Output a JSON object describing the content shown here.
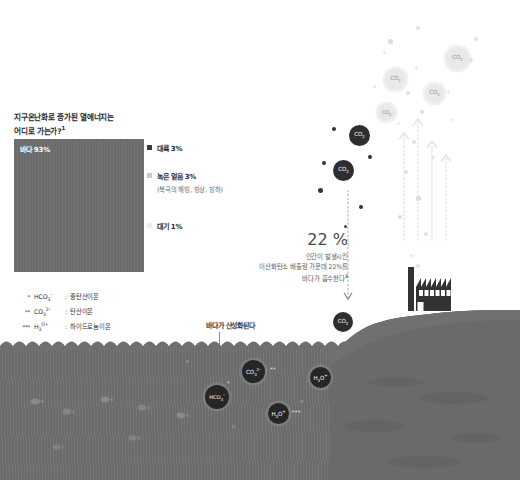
{
  "title": {
    "line1": "지구온난화로 증가된 열에너지는",
    "line2": "어디로 가는가?",
    "footnote_marker": "1"
  },
  "ocean_share": {
    "label": "바다 93%"
  },
  "legend": {
    "items": [
      {
        "label": "대륙 3%",
        "color": "#3a3a3a",
        "sub": null
      },
      {
        "label": "녹은 얼음 3%",
        "color": "#c9c9c9",
        "sub": "(북극의 해빙, 빙상, 빙하)"
      },
      {
        "label": "대기 1%",
        "color": "#ededed",
        "sub": null
      }
    ]
  },
  "footnote_key": {
    "rows": [
      {
        "stars": "*",
        "formula_main": "HCO",
        "formula_sub": "3",
        "formula_sup": "–",
        "separator": ":",
        "meaning": "중탄산이온"
      },
      {
        "stars": "**",
        "formula_main": "CO",
        "formula_sub": "3",
        "formula_sup": "2–",
        "separator": ":",
        "meaning": "탄산이온"
      },
      {
        "stars": "***",
        "formula_main": "H",
        "formula_sub": "3",
        "formula_sup": "O+",
        "separator": ":",
        "meaning": "하이드로늄이온"
      }
    ]
  },
  "percent_callout": {
    "value": "22 %",
    "line1": "인간이 발생시킨",
    "line2": "이산화탄소 배출량 가운데 22%를",
    "line3": "바다가 흡수한다",
    "footnote_marker": "3"
  },
  "acidification": {
    "label": "바다가 산성화된다"
  },
  "molecules": {
    "atmosphere_light": [
      {
        "formula": "CO",
        "sub": "2",
        "x": 446,
        "y": 47,
        "size": 23
      },
      {
        "formula": "CO",
        "sub": "2",
        "x": 385,
        "y": 69,
        "size": 21
      },
      {
        "formula": "CO",
        "sub": "2",
        "x": 425,
        "y": 84,
        "size": 19
      },
      {
        "formula": "CO",
        "sub": "2",
        "x": 378,
        "y": 104,
        "size": 17
      }
    ],
    "atmosphere_dark": [
      {
        "formula": "CO",
        "sub": "2",
        "x": 349,
        "y": 135,
        "size": 21
      },
      {
        "formula": "CO",
        "sub": "2",
        "x": 341,
        "y": 170,
        "size": 21
      },
      {
        "formula": "CO",
        "sub": "2",
        "x": 340,
        "y": 322,
        "size": 20
      }
    ],
    "underwater": [
      {
        "formula": "CO",
        "sub": "3",
        "sup": "2–",
        "stars": "**",
        "x": 253,
        "y": 368,
        "size": 23
      },
      {
        "formula": "HCO",
        "sub": "3",
        "sup": "–",
        "stars": "*",
        "x": 215,
        "y": 393,
        "size": 23
      },
      {
        "formula": "H",
        "sub": "3",
        "sup": "O+",
        "stars": "",
        "x": 317,
        "y": 375,
        "size": 20
      },
      {
        "formula": "H",
        "sub": "3",
        "sup": "O+",
        "stars": "***",
        "x": 277,
        "y": 411,
        "size": 20
      }
    ]
  },
  "colors": {
    "ocean": "#6f6f6f",
    "land": "#6a6a6a",
    "factory": "#333333",
    "molecule_dark": "#2e2e2e",
    "molecule_light": "#e9e9e9",
    "text_primary": "#2b2b2b",
    "text_muted": "#6a6a6a"
  }
}
